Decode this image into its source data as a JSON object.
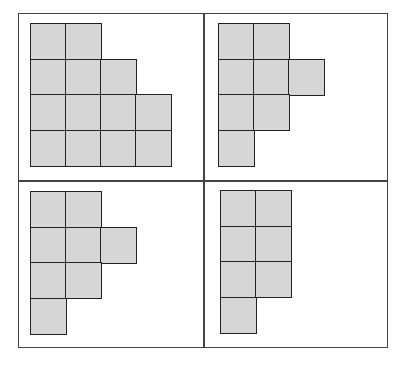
{
  "diagram": {
    "cell_size": 35,
    "cell_fill": "#d6d6d6",
    "line_color": "#222222",
    "panels": [
      {
        "name": "top-left",
        "origin": [
          30,
          23
        ],
        "row_lengths": [
          2,
          3,
          4,
          4
        ]
      },
      {
        "name": "top-right",
        "origin": [
          218,
          23
        ],
        "row_lengths": [
          2,
          3,
          2,
          1
        ]
      },
      {
        "name": "bottom-left",
        "origin": [
          30,
          191
        ],
        "row_lengths": [
          2,
          3,
          2,
          1
        ]
      },
      {
        "name": "bottom-right",
        "origin": [
          220,
          190
        ],
        "row_lengths": [
          2,
          2,
          2,
          1
        ]
      }
    ]
  }
}
